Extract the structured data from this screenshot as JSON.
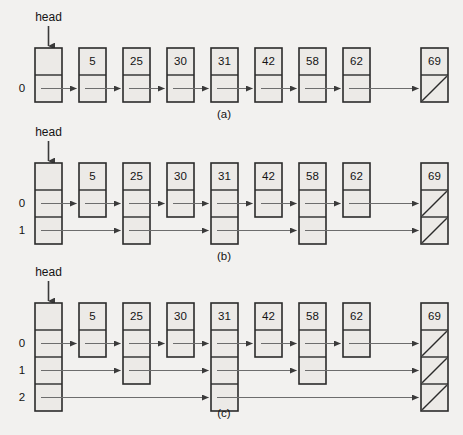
{
  "figure": {
    "background_color": "#f2f1ef",
    "node_fill": "#eceae7",
    "stroke_color": "#2b2b2b",
    "link_color": "#6d6d6d",
    "width": 463,
    "height": 435
  },
  "head_label": "head",
  "captions": [
    {
      "id": "a",
      "text": "(a)"
    },
    {
      "id": "b",
      "text": "(b)"
    },
    {
      "id": "c",
      "text": "(c)"
    }
  ],
  "panels": [
    {
      "id": "a",
      "caption": "(a)",
      "level_labels": [
        "0"
      ],
      "head_levels": 1,
      "nodes": [
        {
          "value": "5",
          "levels": 1
        },
        {
          "value": "25",
          "levels": 1
        },
        {
          "value": "30",
          "levels": 1
        },
        {
          "value": "31",
          "levels": 1
        },
        {
          "value": "42",
          "levels": 1
        },
        {
          "value": "58",
          "levels": 1
        },
        {
          "value": "62",
          "levels": 1
        },
        {
          "value": "69",
          "levels": 1,
          "terminal": true
        }
      ],
      "terminal_null_levels": [
        "0"
      ]
    },
    {
      "id": "b",
      "caption": "(b)",
      "level_labels": [
        "0",
        "1"
      ],
      "head_levels": 2,
      "nodes": [
        {
          "value": "5",
          "levels": 1
        },
        {
          "value": "25",
          "levels": 2
        },
        {
          "value": "30",
          "levels": 1
        },
        {
          "value": "31",
          "levels": 2
        },
        {
          "value": "42",
          "levels": 1
        },
        {
          "value": "58",
          "levels": 2
        },
        {
          "value": "62",
          "levels": 1
        },
        {
          "value": "69",
          "levels": 2,
          "terminal": true
        }
      ],
      "terminal_null_levels": [
        "0",
        "1"
      ]
    },
    {
      "id": "c",
      "caption": "(c)",
      "level_labels": [
        "0",
        "1",
        "2"
      ],
      "head_levels": 3,
      "nodes": [
        {
          "value": "5",
          "levels": 1
        },
        {
          "value": "25",
          "levels": 2
        },
        {
          "value": "30",
          "levels": 1
        },
        {
          "value": "31",
          "levels": 3
        },
        {
          "value": "42",
          "levels": 1
        },
        {
          "value": "58",
          "levels": 2
        },
        {
          "value": "62",
          "levels": 1
        },
        {
          "value": "69",
          "levels": 3,
          "terminal": true
        }
      ],
      "terminal_null_levels": [
        "0",
        "1",
        "2"
      ]
    }
  ]
}
